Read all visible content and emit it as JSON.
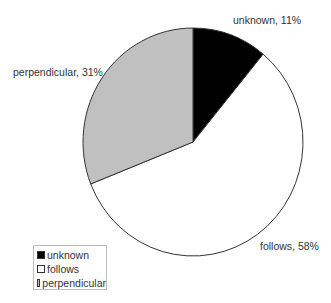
{
  "chart_data": {
    "type": "pie",
    "title": "",
    "start_angle": "12 o'clock",
    "direction": "clockwise",
    "categories": [
      "unknown",
      "follows",
      "perpendicular"
    ],
    "values": [
      11,
      58,
      31
    ],
    "unit": "%",
    "colors": [
      "#000000",
      "#ffffff",
      "#c0c0c0"
    ],
    "data_labels": [
      "unknown, 11%",
      "follows, 58%",
      "perpendicular, 31%"
    ],
    "legend": {
      "position": "bottom-left",
      "entries": [
        "unknown",
        "follows",
        "perpendicular"
      ]
    }
  }
}
